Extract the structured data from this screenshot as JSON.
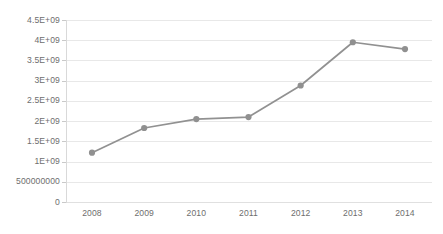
{
  "chart_data": {
    "type": "line",
    "title": "",
    "subtitle": "",
    "xlabel": "",
    "ylabel": "",
    "categories": [
      "2008",
      "2009",
      "2010",
      "2011",
      "2012",
      "2013",
      "2014"
    ],
    "x": [
      2008,
      2009,
      2010,
      2011,
      2012,
      2013,
      2014
    ],
    "values": [
      1220000000,
      1830000000,
      2050000000,
      2100000000,
      2880000000,
      3950000000,
      3780000000
    ],
    "series": [
      {
        "name": "",
        "values": [
          1220000000,
          1830000000,
          2050000000,
          2100000000,
          2880000000,
          3950000000,
          3780000000
        ]
      }
    ],
    "ylim": [
      0,
      4500000000
    ],
    "ytick_values": [
      0,
      500000000,
      1000000000,
      1500000000,
      2000000000,
      2500000000,
      3000000000,
      3500000000,
      4000000000,
      4500000000
    ],
    "ytick_labels": [
      "0",
      "500000000",
      "1E+09",
      "1.5E+09",
      "2E+09",
      "2.5E+09",
      "3E+09",
      "3.5E+09",
      "4E+09",
      "4.5E+09"
    ],
    "xtick_labels": [
      "2008",
      "2009",
      "2010",
      "2011",
      "2012",
      "2013",
      "2014"
    ],
    "grid": true,
    "grid_axis": "y",
    "legend": false,
    "legend_position": "none",
    "annotations": [],
    "markers": "circle"
  },
  "style": {
    "background_color": "#ffffff",
    "line_color": "#919191",
    "marker_color": "#909090",
    "gridline_color": "#e8e8e8",
    "axis_color": "#d9d9d9",
    "tick_label_color": "#6e6e6e"
  }
}
